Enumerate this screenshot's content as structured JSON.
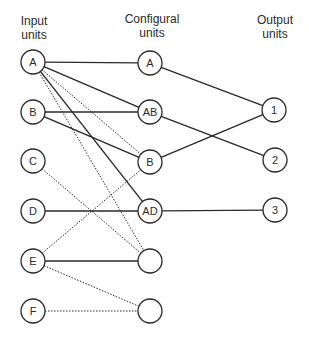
{
  "headers": {
    "input": [
      "Input",
      "units"
    ],
    "configural": [
      "Configural",
      "units"
    ],
    "output": [
      "Output",
      "units"
    ]
  },
  "colors": {
    "stroke": "#2a2a2a",
    "background": "#ffffff"
  },
  "nodes": {
    "input": [
      {
        "id": "in-A",
        "label": "A",
        "x": 33,
        "y": 62
      },
      {
        "id": "in-B",
        "label": "B",
        "x": 33,
        "y": 112
      },
      {
        "id": "in-C",
        "label": "C",
        "x": 33,
        "y": 161
      },
      {
        "id": "in-D",
        "label": "D",
        "x": 33,
        "y": 211
      },
      {
        "id": "in-E",
        "label": "E",
        "x": 33,
        "y": 261
      },
      {
        "id": "in-F",
        "label": "F",
        "x": 33,
        "y": 311
      }
    ],
    "configural": [
      {
        "id": "cf-A",
        "label": "A",
        "x": 150,
        "y": 63
      },
      {
        "id": "cf-AB",
        "label": "AB",
        "x": 150,
        "y": 112
      },
      {
        "id": "cf-B",
        "label": "B",
        "x": 150,
        "y": 162
      },
      {
        "id": "cf-AD",
        "label": "AD",
        "x": 150,
        "y": 211
      },
      {
        "id": "cf-blank1",
        "label": "",
        "x": 150,
        "y": 261
      },
      {
        "id": "cf-blank2",
        "label": "",
        "x": 150,
        "y": 311
      }
    ],
    "output": [
      {
        "id": "out-1",
        "label": "1",
        "x": 274,
        "y": 110
      },
      {
        "id": "out-2",
        "label": "2",
        "x": 275,
        "y": 160
      },
      {
        "id": "out-3",
        "label": "3",
        "x": 275,
        "y": 210
      }
    ]
  },
  "edges": [
    {
      "from": "in-A",
      "to": "cf-A",
      "style": "solid"
    },
    {
      "from": "in-A",
      "to": "cf-AB",
      "style": "solid"
    },
    {
      "from": "in-A",
      "to": "cf-B",
      "style": "dotted"
    },
    {
      "from": "in-A",
      "to": "cf-AD",
      "style": "solid"
    },
    {
      "from": "in-A",
      "to": "cf-blank1",
      "style": "dotted"
    },
    {
      "from": "in-B",
      "to": "cf-AB",
      "style": "solid"
    },
    {
      "from": "in-B",
      "to": "cf-B",
      "style": "solid"
    },
    {
      "from": "in-C",
      "to": "cf-blank1",
      "style": "dotted"
    },
    {
      "from": "in-D",
      "to": "cf-AD",
      "style": "solid"
    },
    {
      "from": "in-E",
      "to": "cf-B",
      "style": "dotted"
    },
    {
      "from": "in-E",
      "to": "cf-blank1",
      "style": "solid"
    },
    {
      "from": "in-E",
      "to": "cf-blank2",
      "style": "dotted"
    },
    {
      "from": "in-F",
      "to": "cf-blank2",
      "style": "dotted"
    },
    {
      "from": "cf-A",
      "to": "out-1",
      "style": "solid"
    },
    {
      "from": "cf-AB",
      "to": "out-2",
      "style": "solid"
    },
    {
      "from": "cf-B",
      "to": "out-1",
      "style": "solid"
    },
    {
      "from": "cf-AD",
      "to": "out-3",
      "style": "solid"
    }
  ],
  "node_radius": 12
}
